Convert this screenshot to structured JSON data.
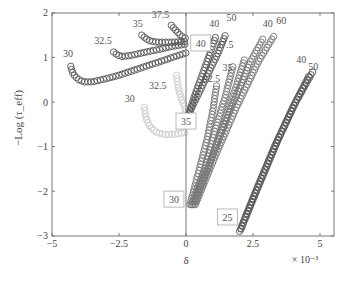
{
  "chart_data": {
    "type": "scatter",
    "title": "",
    "xlabel": "δ",
    "ylabel": "−Log (τ_eff)",
    "x_multiplier": "× 10⁻³",
    "xlim": [
      -5,
      5.3
    ],
    "ylim": [
      -3,
      2
    ],
    "x_ticks": [
      -5,
      -2.5,
      0,
      2.5,
      5
    ],
    "x_tick_labels": [
      "−5",
      "−2.5",
      "0",
      "2.5",
      "5"
    ],
    "y_ticks": [
      2,
      1,
      0,
      -1,
      -2,
      -3
    ],
    "y_tick_labels": [
      "2",
      "1",
      "0",
      "−1",
      "−2",
      "−3"
    ],
    "grid": false,
    "marker": "open circle",
    "vertical_reference_line": 0,
    "series": [
      {
        "name": "curve-30-dark",
        "color": "#555555",
        "label": "30",
        "points": [
          [
            -4.3,
            0.8
          ],
          [
            -4.25,
            0.68
          ],
          [
            -4.15,
            0.58
          ],
          [
            -4.0,
            0.5
          ],
          [
            -3.8,
            0.45
          ],
          [
            -3.5,
            0.45
          ],
          [
            -3.0,
            0.52
          ],
          [
            -2.5,
            0.6
          ],
          [
            -2.0,
            0.7
          ],
          [
            -1.5,
            0.8
          ],
          [
            -1.0,
            0.9
          ],
          [
            -0.5,
            1.0
          ],
          [
            0,
            1.1
          ]
        ]
      },
      {
        "name": "curve-32.5-dark",
        "color": "#555555",
        "label": "32.5",
        "points": [
          [
            -2.7,
            1.12
          ],
          [
            -2.55,
            1.05
          ],
          [
            -2.35,
            1.02
          ],
          [
            -2.0,
            1.05
          ],
          [
            -1.5,
            1.12
          ],
          [
            -1.0,
            1.18
          ],
          [
            -0.5,
            1.25
          ],
          [
            0,
            1.3
          ]
        ]
      },
      {
        "name": "curve-35-dark",
        "color": "#555555",
        "label": "35",
        "points": [
          [
            -1.65,
            1.5
          ],
          [
            -1.5,
            1.42
          ],
          [
            -1.3,
            1.36
          ],
          [
            -1.0,
            1.34
          ],
          [
            -0.5,
            1.34
          ],
          [
            0,
            1.36
          ]
        ]
      },
      {
        "name": "curve-37.5-dark",
        "color": "#555555",
        "label": "37.5",
        "points": [
          [
            -0.55,
            1.72
          ],
          [
            -0.4,
            1.62
          ],
          [
            -0.25,
            1.52
          ],
          [
            -0.1,
            1.45
          ],
          [
            0,
            1.42
          ]
        ]
      },
      {
        "name": "curve-30-light",
        "color": "#cccccc",
        "label": "30",
        "points": [
          [
            -1.55,
            -0.12
          ],
          [
            -1.5,
            -0.35
          ],
          [
            -1.35,
            -0.55
          ],
          [
            -1.1,
            -0.68
          ],
          [
            -0.8,
            -0.73
          ],
          [
            -0.4,
            -0.72
          ],
          [
            0,
            -0.68
          ]
        ]
      },
      {
        "name": "curve-32.5-light",
        "color": "#cccccc",
        "label": "32.5",
        "points": [
          [
            -0.35,
            0.6
          ],
          [
            -0.3,
            0.35
          ],
          [
            -0.2,
            0.12
          ],
          [
            -0.05,
            -0.1
          ],
          [
            0.05,
            -0.35
          ],
          [
            0.1,
            -0.55
          ]
        ]
      },
      {
        "name": "line-35-to-40",
        "color": "#555555",
        "box_label": "35",
        "end_label": "40",
        "points": [
          [
            0,
            -0.45
          ],
          [
            0.3,
            0.1
          ],
          [
            0.6,
            0.6
          ],
          [
            0.9,
            1.1
          ],
          [
            1.1,
            1.45
          ]
        ]
      },
      {
        "name": "line-35-to-50",
        "color": "#555555",
        "end_label": "50",
        "points": [
          [
            0,
            -0.4
          ],
          [
            0.4,
            0.1
          ],
          [
            0.8,
            0.6
          ],
          [
            1.2,
            1.1
          ],
          [
            1.5,
            1.55
          ]
        ]
      },
      {
        "name": "line-30-to-32.5",
        "color": "#777777",
        "box_label": "30",
        "end_label": "32.5",
        "points": [
          [
            0.15,
            -2.3
          ],
          [
            0.5,
            -1.5
          ],
          [
            0.8,
            -0.8
          ],
          [
            1.0,
            -0.2
          ],
          [
            1.15,
            0.4
          ]
        ]
      },
      {
        "name": "line-30-to-35",
        "color": "#777777",
        "end_label": "35",
        "points": [
          [
            0.2,
            -2.3
          ],
          [
            0.7,
            -1.5
          ],
          [
            1.1,
            -0.6
          ],
          [
            1.5,
            0.2
          ],
          [
            1.75,
            0.8
          ]
        ]
      },
      {
        "name": "line-30-to-37.5",
        "color": "#777777",
        "end_label": "37.5",
        "points": [
          [
            0.25,
            -2.3
          ],
          [
            0.8,
            -1.5
          ],
          [
            1.4,
            -0.5
          ],
          [
            1.9,
            0.4
          ],
          [
            2.2,
            1.0
          ]
        ]
      },
      {
        "name": "line-30-to-40",
        "color": "#777777",
        "end_label": "40",
        "points": [
          [
            0.3,
            -2.3
          ],
          [
            1.0,
            -1.2
          ],
          [
            1.7,
            -0.1
          ],
          [
            2.4,
            0.9
          ],
          [
            2.9,
            1.45
          ]
        ]
      },
      {
        "name": "line-30-to-60",
        "color": "#777777",
        "end_label": "60",
        "points": [
          [
            0.35,
            -2.3
          ],
          [
            1.1,
            -1.2
          ],
          [
            1.9,
            -0.1
          ],
          [
            2.7,
            0.9
          ],
          [
            3.3,
            1.5
          ]
        ]
      },
      {
        "name": "line-25-to-40",
        "color": "#555555",
        "box_label": "25",
        "end_label": "40",
        "points": [
          [
            2.0,
            -2.9
          ],
          [
            2.6,
            -2.0
          ],
          [
            3.3,
            -1.0
          ],
          [
            4.0,
            -0.1
          ],
          [
            4.6,
            0.6
          ]
        ]
      },
      {
        "name": "line-25-to-50",
        "color": "#555555",
        "end_label": "50",
        "points": [
          [
            2.05,
            -2.85
          ],
          [
            2.7,
            -1.9
          ],
          [
            3.4,
            -0.9
          ],
          [
            4.1,
            0.0
          ],
          [
            4.75,
            0.7
          ]
        ]
      }
    ],
    "annotations": [
      {
        "text": "30",
        "x": -4.4,
        "y": 1.0,
        "style": "dark"
      },
      {
        "text": "32.5",
        "x": -3.1,
        "y": 1.3,
        "style": "dark"
      },
      {
        "text": "35",
        "x": -1.8,
        "y": 1.68,
        "style": "dark"
      },
      {
        "text": "37.5",
        "x": -0.95,
        "y": 1.88,
        "style": "dark"
      },
      {
        "text": "30",
        "x": -2.1,
        "y": 0.0,
        "style": "dark"
      },
      {
        "text": "32.5",
        "x": -1.05,
        "y": 0.3,
        "style": "dark"
      },
      {
        "text": "40",
        "x": 1.05,
        "y": 1.68,
        "style": "dark"
      },
      {
        "text": "50",
        "x": 1.7,
        "y": 1.82,
        "style": "dark"
      },
      {
        "text": "37.5",
        "x": 1.45,
        "y": 1.2,
        "style": "dark"
      },
      {
        "text": "35",
        "x": 1.55,
        "y": 0.7,
        "style": "dark"
      },
      {
        "text": "32.5",
        "x": 0.95,
        "y": 0.45,
        "style": "dark"
      },
      {
        "text": "40",
        "x": 3.05,
        "y": 1.68,
        "style": "dark"
      },
      {
        "text": "60",
        "x": 3.55,
        "y": 1.75,
        "style": "dark"
      },
      {
        "text": "40",
        "x": 4.3,
        "y": 0.88,
        "style": "dark"
      },
      {
        "text": "50",
        "x": 4.75,
        "y": 0.72,
        "style": "dark"
      }
    ],
    "boxed_labels": [
      {
        "text": "40",
        "x": 0.55,
        "y": 1.3
      },
      {
        "text": "35",
        "x": 0.0,
        "y": -0.45
      },
      {
        "text": "30",
        "x": -0.45,
        "y": -2.2
      },
      {
        "text": "25",
        "x": 1.55,
        "y": -2.6
      }
    ]
  }
}
